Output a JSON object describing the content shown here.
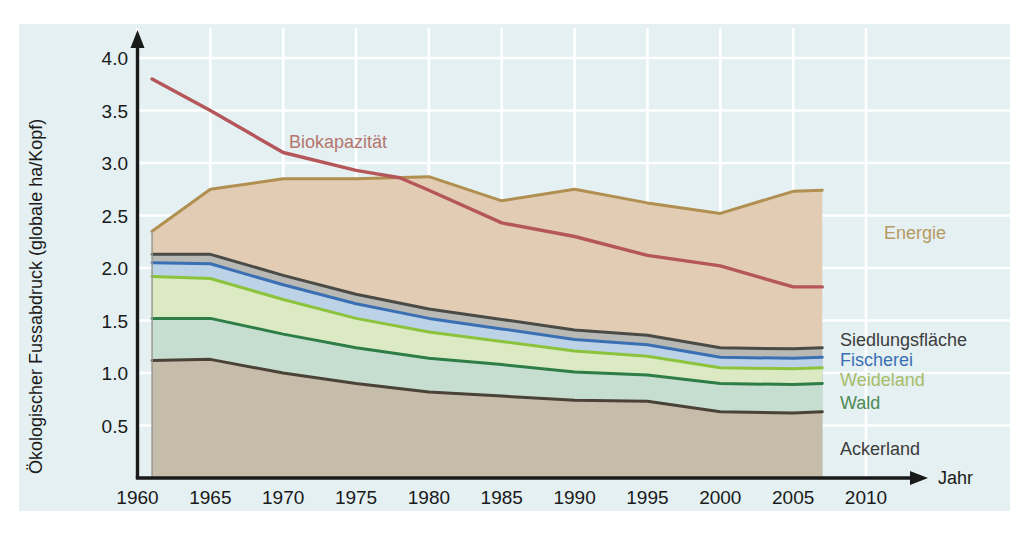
{
  "figure": {
    "background_panel_color": "#e4f0f2",
    "outer_background_color": "#ffffff",
    "grid_color": "#ffffff",
    "axis_color": "#1a1a1a"
  },
  "axes": {
    "y_title": "Ökologischer Fussabdruck (globale ha/Kopf)",
    "x_title": "Jahr",
    "y_ticks": [
      "0.5",
      "1.0",
      "1.5",
      "2.0",
      "2.5",
      "3.0",
      "3.5",
      "4.0"
    ],
    "x_ticks": [
      "1960",
      "1965",
      "1970",
      "1975",
      "1980",
      "1985",
      "1990",
      "1995",
      "2000",
      "2005",
      "2010"
    ]
  },
  "labels": {
    "biokapazitaet": "Biokapazität",
    "energie": "Energie",
    "siedlungsflaeche": "Siedlungsfläche",
    "fischerei": "Fischerei",
    "weideland": "Weideland",
    "wald": "Wald",
    "ackerland": "Ackerland"
  },
  "colors": {
    "biokapazitaet_line": "#b4565a",
    "biokapazitaet_label": "#b4766e",
    "energie_fill": "#e2cdb4",
    "energie_line": "#b08f50",
    "energie_label": "#b89a63",
    "siedlungsflaeche_fill": "#b8b8b4",
    "siedlungsflaeche_line": "#4a4a46",
    "siedlungsflaeche_label": "#3c3c3c",
    "fischerei_fill": "#bcd2e6",
    "fischerei_line": "#3a6fb4",
    "fischerei_label": "#3a6fb4",
    "weideland_fill": "#dceac4",
    "weideland_line": "#8cc33c",
    "weideland_label": "#a8bc6a",
    "wald_fill": "#c6ded0",
    "wald_line": "#2e7d46",
    "wald_label": "#4c8a56",
    "ackerland_fill": "#c6bcaa",
    "ackerland_line": "#4a4236",
    "ackerland_label": "#3c3c3c"
  },
  "chart_data": {
    "type": "area",
    "title": "",
    "xlabel": "Jahr",
    "ylabel": "Ökologischer Fussabdruck (globale ha/Kopf)",
    "xlim": [
      1960,
      2010
    ],
    "ylim": [
      0,
      4.2
    ],
    "grid": true,
    "stacked": true,
    "legend": "inline-right",
    "x": [
      1961,
      1965,
      1970,
      1975,
      1980,
      1985,
      1990,
      1995,
      2000,
      2005,
      2007
    ],
    "series": [
      {
        "name": "Ackerland",
        "stack_order": 1,
        "values": [
          1.12,
          1.13,
          1.0,
          0.9,
          0.82,
          0.78,
          0.74,
          0.73,
          0.63,
          0.62,
          0.63
        ]
      },
      {
        "name": "Wald",
        "stack_order": 2,
        "values": [
          0.4,
          0.39,
          0.37,
          0.34,
          0.32,
          0.3,
          0.27,
          0.25,
          0.27,
          0.27,
          0.27
        ]
      },
      {
        "name": "Weideland",
        "stack_order": 3,
        "values": [
          0.4,
          0.38,
          0.33,
          0.28,
          0.25,
          0.22,
          0.2,
          0.18,
          0.15,
          0.15,
          0.15
        ]
      },
      {
        "name": "Fischerei",
        "stack_order": 4,
        "values": [
          0.13,
          0.14,
          0.14,
          0.14,
          0.13,
          0.12,
          0.11,
          0.11,
          0.1,
          0.1,
          0.1
        ]
      },
      {
        "name": "Siedlungsfläche",
        "stack_order": 5,
        "values": [
          0.08,
          0.09,
          0.09,
          0.09,
          0.09,
          0.09,
          0.09,
          0.09,
          0.09,
          0.09,
          0.09
        ]
      },
      {
        "name": "Energie",
        "stack_order": 6,
        "values": [
          0.22,
          0.62,
          1.02,
          1.13,
          1.26,
          1.13,
          1.34,
          1.19,
          1.28,
          1.5,
          1.5
        ]
      }
    ],
    "cumulative_tops": {
      "Ackerland": [
        1.12,
        1.13,
        1.0,
        0.9,
        0.82,
        0.78,
        0.74,
        0.73,
        0.63,
        0.62,
        0.63
      ],
      "Wald": [
        1.52,
        1.52,
        1.37,
        1.24,
        1.14,
        1.08,
        1.01,
        0.98,
        0.9,
        0.89,
        0.9
      ],
      "Weideland": [
        1.92,
        1.9,
        1.7,
        1.52,
        1.39,
        1.3,
        1.21,
        1.16,
        1.05,
        1.04,
        1.05
      ],
      "Fischerei": [
        2.05,
        2.04,
        1.84,
        1.66,
        1.52,
        1.42,
        1.32,
        1.27,
        1.15,
        1.14,
        1.15
      ],
      "Siedlungsfläche": [
        2.13,
        2.13,
        1.93,
        1.75,
        1.61,
        1.51,
        1.41,
        1.36,
        1.24,
        1.23,
        1.24
      ],
      "Energie": [
        2.35,
        2.75,
        2.85,
        2.85,
        2.87,
        2.64,
        2.75,
        2.62,
        2.52,
        2.73,
        2.74
      ]
    },
    "biokapazitaet": {
      "name": "Biokapazität",
      "x": [
        1961,
        1965,
        1970,
        1975,
        1978,
        1980,
        1985,
        1990,
        1995,
        2000,
        2005,
        2007
      ],
      "values": [
        3.8,
        3.5,
        3.1,
        2.93,
        2.86,
        2.74,
        2.43,
        2.3,
        2.12,
        2.02,
        1.82,
        1.82
      ]
    }
  }
}
